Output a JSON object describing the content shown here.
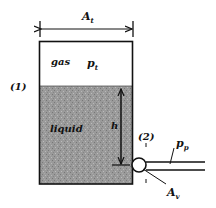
{
  "diagram": {
    "type": "pressurized-tank-schematic",
    "labels": {
      "tank_area": "A",
      "tank_area_sub": "t",
      "gas": "gas",
      "gas_pressure": "p",
      "gas_pressure_sub": "t",
      "section_1": "(1)",
      "liquid": "liquid",
      "height": "h",
      "section_2": "(2)",
      "pipe_pressure": "p",
      "pipe_pressure_sub": "p",
      "valve_area": "A",
      "valve_area_sub": "v"
    },
    "colors": {
      "line": "#111111",
      "liquid_fill": "#9a9a9a",
      "gas_fill": "#ffffff",
      "background": "#ffffff"
    }
  }
}
